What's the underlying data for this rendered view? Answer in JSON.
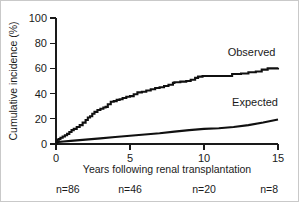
{
  "chart_data": {
    "type": "line",
    "title": "",
    "subtitle": "",
    "xlabel": "Years following renal transplantation",
    "ylabel": "Cumulative incidence (%)",
    "xlim": [
      0,
      15
    ],
    "ylim": [
      0,
      100
    ],
    "xticks": [
      0,
      5,
      10,
      15
    ],
    "xtick_labels": [
      "0",
      "5",
      "10",
      "15"
    ],
    "yticks": [
      0,
      20,
      40,
      60,
      80,
      100
    ],
    "ytick_labels": [
      "0",
      "20",
      "40",
      "60",
      "80",
      "100"
    ],
    "grid": false,
    "legend_position": "inline-annotation",
    "series": [
      {
        "name": "Observed",
        "style": "step",
        "label_x": 11.6,
        "label_y": 70,
        "x": [
          0,
          0.05,
          0.1,
          0.2,
          0.3,
          0.45,
          0.6,
          0.75,
          0.9,
          1.05,
          1.2,
          1.4,
          1.6,
          1.8,
          2.0,
          2.15,
          2.3,
          2.45,
          2.6,
          2.8,
          3.0,
          3.2,
          3.35,
          3.5,
          3.7,
          3.9,
          4.1,
          4.3,
          4.5,
          4.75,
          5.0,
          5.25,
          5.5,
          5.8,
          6.1,
          6.4,
          6.7,
          7.0,
          7.3,
          7.6,
          7.9,
          8.0,
          8.4,
          8.8,
          9.1,
          9.4,
          9.6,
          9.9,
          10.5,
          11.2,
          11.9,
          12.5,
          13.0,
          13.5,
          13.9,
          14.3,
          15.0
        ],
        "y": [
          0,
          2.5,
          3.5,
          4.0,
          5.0,
          6.0,
          7.0,
          8.0,
          9.5,
          11.0,
          12.0,
          13.5,
          15.0,
          17.0,
          19.0,
          21.0,
          22.0,
          24.0,
          25.5,
          27.0,
          28.0,
          29.0,
          29.5,
          31.5,
          33.5,
          34.0,
          35.0,
          35.5,
          36.5,
          37.5,
          38.0,
          39.5,
          41.0,
          41.5,
          42.5,
          43.5,
          44.5,
          45.0,
          46.0,
          47.0,
          48.5,
          49.0,
          49.5,
          50.0,
          51.0,
          52.5,
          53.5,
          54.0,
          54.0,
          54.0,
          55.5,
          56.0,
          57.0,
          57.5,
          59.0,
          60.0,
          60.5
        ]
      },
      {
        "name": "Expected",
        "style": "line",
        "label_x": 11.9,
        "label_y": 30,
        "x": [
          0,
          0.5,
          1,
          2,
          3,
          4,
          5,
          6,
          7,
          8,
          9,
          10,
          11,
          12,
          13,
          14,
          15
        ],
        "y": [
          1.5,
          2.0,
          2.5,
          3.5,
          4.5,
          5.5,
          6.5,
          7.5,
          8.5,
          9.8,
          11.0,
          12.0,
          12.5,
          13.5,
          15.0,
          17.0,
          19.5
        ]
      }
    ],
    "n_at_risk": {
      "label_prefix": "n=",
      "entries": [
        {
          "x": 0,
          "label": "n=86",
          "value": 86
        },
        {
          "x": 5,
          "label": "n=46",
          "value": 46
        },
        {
          "x": 10,
          "label": "n=20",
          "value": 20
        },
        {
          "x": 15,
          "label": "n=8",
          "value": 8
        }
      ]
    },
    "colors": {
      "line": "#101010",
      "axis": "#1a1a1a",
      "text": "#1a1a1a",
      "background": "#ffffff",
      "frame": "#c9c9c9"
    }
  }
}
